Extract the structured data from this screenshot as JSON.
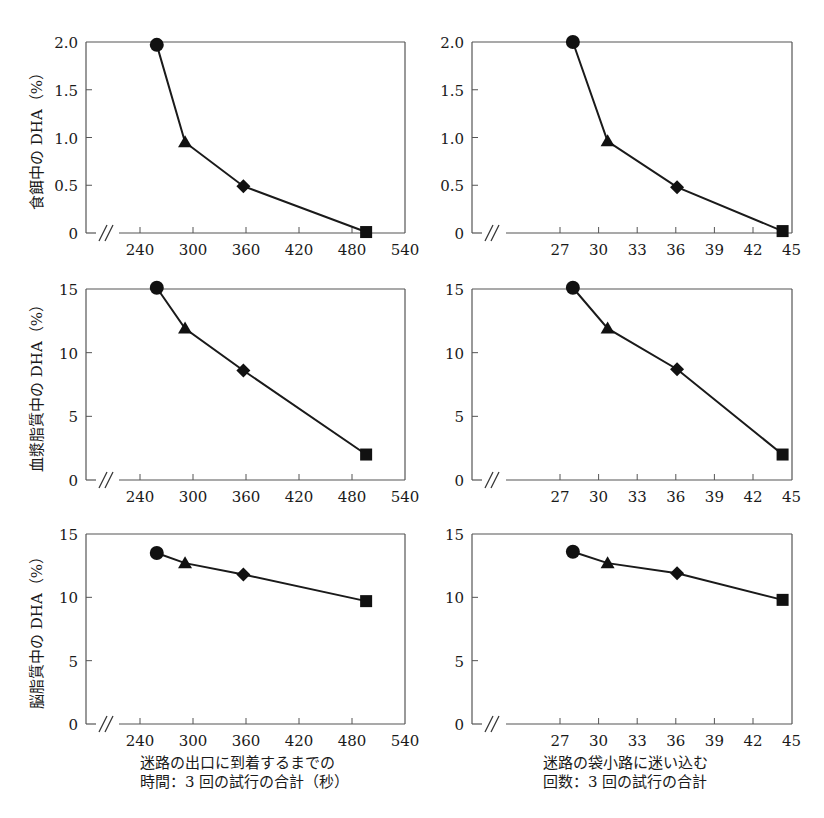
{
  "figure": {
    "markers_legend": [
      "circle",
      "triangle",
      "diamond",
      "square"
    ]
  },
  "x_axes": {
    "left": {
      "label_lines": [
        "迷路の出口に到着するまでの",
        "時間：3 回の試行の合計（秒）"
      ],
      "ticks": [
        240,
        300,
        360,
        420,
        480,
        540
      ],
      "range": [
        210,
        540
      ],
      "break_mark": "//"
    },
    "right": {
      "label_lines": [
        "迷路の袋小路に迷い込む",
        "回数：3 回の試行の合計"
      ],
      "ticks": [
        27,
        30,
        33,
        36,
        39,
        42,
        45
      ],
      "range": [
        18,
        45
      ],
      "break_mark": "//"
    }
  },
  "y_axes": {
    "row1": {
      "label": "食餌中の DHA（%）",
      "ticks": [
        "0",
        "0.5",
        "1.0",
        "1.5",
        "2.0"
      ],
      "tick_values": [
        0,
        0.5,
        1.0,
        1.5,
        2.0
      ],
      "range": [
        0,
        2.0
      ]
    },
    "row2": {
      "label": "血漿脂質中の DHA（%）",
      "ticks": [
        "0",
        "5",
        "10",
        "15"
      ],
      "tick_values": [
        0,
        5,
        10,
        15
      ],
      "range": [
        0,
        15
      ]
    },
    "row3": {
      "label": "脳脂質中の DHA（%）",
      "ticks": [
        "0",
        "5",
        "10",
        "15"
      ],
      "tick_values": [
        0,
        5,
        10,
        15
      ],
      "range": [
        0,
        15
      ]
    }
  },
  "chart_data": [
    {
      "id": "row1-left",
      "type": "line",
      "title": "",
      "xlabel": "迷路の出口に到着するまでの時間：3 回の試行の合計（秒）",
      "ylabel": "食餌中の DHA（%）",
      "xlim": [
        210,
        540
      ],
      "ylim": [
        0,
        2.0
      ],
      "x_ticks": [
        240,
        300,
        360,
        420,
        480,
        540
      ],
      "y_ticks": [
        0,
        0.5,
        1.0,
        1.5,
        2.0
      ],
      "grid": false,
      "x_axis_break": true,
      "points": [
        {
          "x": 259,
          "y": 1.97,
          "marker": "circle"
        },
        {
          "x": 291,
          "y": 0.95,
          "marker": "triangle"
        },
        {
          "x": 357,
          "y": 0.49,
          "marker": "diamond"
        },
        {
          "x": 496,
          "y": 0.01,
          "marker": "square"
        }
      ]
    },
    {
      "id": "row1-right",
      "type": "line",
      "title": "",
      "xlabel": "迷路の袋小路に迷い込む回数：3 回の試行の合計",
      "ylabel": "",
      "xlim": [
        18,
        45
      ],
      "ylim": [
        0,
        2.0
      ],
      "x_ticks": [
        27,
        30,
        33,
        36,
        39,
        42,
        45
      ],
      "y_ticks": [
        0,
        0.5,
        1.0,
        1.5,
        2.0
      ],
      "grid": false,
      "x_axis_break": true,
      "points": [
        {
          "x": 28.0,
          "y": 2.0,
          "marker": "circle"
        },
        {
          "x": 30.7,
          "y": 0.96,
          "marker": "triangle"
        },
        {
          "x": 36.1,
          "y": 0.48,
          "marker": "diamond"
        },
        {
          "x": 44.3,
          "y": 0.02,
          "marker": "square"
        }
      ]
    },
    {
      "id": "row2-left",
      "type": "line",
      "title": "",
      "xlabel": "迷路の出口に到着するまでの時間：3 回の試行の合計（秒）",
      "ylabel": "血漿脂質中の DHA（%）",
      "xlim": [
        210,
        540
      ],
      "ylim": [
        0,
        15
      ],
      "x_ticks": [
        240,
        300,
        360,
        420,
        480,
        540
      ],
      "y_ticks": [
        0,
        5,
        10,
        15
      ],
      "grid": false,
      "x_axis_break": true,
      "points": [
        {
          "x": 259,
          "y": 15.1,
          "marker": "circle"
        },
        {
          "x": 291,
          "y": 11.9,
          "marker": "triangle"
        },
        {
          "x": 357,
          "y": 8.6,
          "marker": "diamond"
        },
        {
          "x": 496,
          "y": 2.0,
          "marker": "square"
        }
      ]
    },
    {
      "id": "row2-right",
      "type": "line",
      "title": "",
      "xlabel": "迷路の袋小路に迷い込む回数：3 回の試行の合計",
      "ylabel": "",
      "xlim": [
        18,
        45
      ],
      "ylim": [
        0,
        15
      ],
      "x_ticks": [
        27,
        30,
        33,
        36,
        39,
        42,
        45
      ],
      "y_ticks": [
        0,
        5,
        10,
        15
      ],
      "grid": false,
      "x_axis_break": true,
      "points": [
        {
          "x": 28.0,
          "y": 15.1,
          "marker": "circle"
        },
        {
          "x": 30.7,
          "y": 11.9,
          "marker": "triangle"
        },
        {
          "x": 36.1,
          "y": 8.7,
          "marker": "diamond"
        },
        {
          "x": 44.3,
          "y": 2.0,
          "marker": "square"
        }
      ]
    },
    {
      "id": "row3-left",
      "type": "line",
      "title": "",
      "xlabel": "迷路の出口に到着するまでの時間：3 回の試行の合計（秒）",
      "ylabel": "脳脂質中の DHA（%）",
      "xlim": [
        210,
        540
      ],
      "ylim": [
        0,
        15
      ],
      "x_ticks": [
        240,
        300,
        360,
        420,
        480,
        540
      ],
      "y_ticks": [
        0,
        5,
        10,
        15
      ],
      "grid": false,
      "x_axis_break": true,
      "points": [
        {
          "x": 259,
          "y": 13.5,
          "marker": "circle"
        },
        {
          "x": 291,
          "y": 12.7,
          "marker": "triangle"
        },
        {
          "x": 357,
          "y": 11.8,
          "marker": "diamond"
        },
        {
          "x": 496,
          "y": 9.7,
          "marker": "square"
        }
      ]
    },
    {
      "id": "row3-right",
      "type": "line",
      "title": "",
      "xlabel": "迷路の袋小路に迷い込む回数：3 回の試行の合計",
      "ylabel": "",
      "xlim": [
        18,
        45
      ],
      "ylim": [
        0,
        15
      ],
      "x_ticks": [
        27,
        30,
        33,
        36,
        39,
        42,
        45
      ],
      "y_ticks": [
        0,
        5,
        10,
        15
      ],
      "grid": false,
      "x_axis_break": true,
      "points": [
        {
          "x": 28.0,
          "y": 13.6,
          "marker": "circle"
        },
        {
          "x": 30.7,
          "y": 12.7,
          "marker": "triangle"
        },
        {
          "x": 36.1,
          "y": 11.9,
          "marker": "diamond"
        },
        {
          "x": 44.3,
          "y": 9.8,
          "marker": "square"
        }
      ]
    }
  ]
}
